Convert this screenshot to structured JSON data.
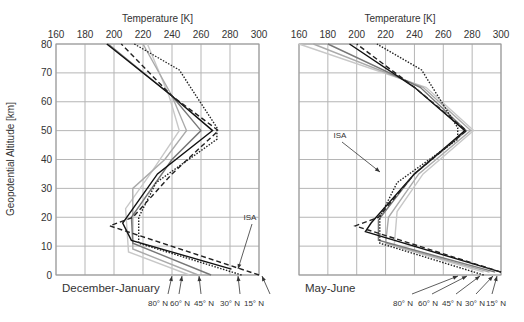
{
  "figure": {
    "ylabel": "Geopotential Altitude [km]",
    "isa_label": "ISA",
    "latitude_labels": [
      "80° N",
      "60° N",
      "45° N",
      "30° N",
      "15° N"
    ]
  },
  "chart_data": [
    {
      "type": "line",
      "title": "December-January",
      "xlabel": "Temperature [K]",
      "ylabel": "Geopotential Altitude [km]",
      "xlim": [
        160,
        300
      ],
      "ylim": [
        0,
        80
      ],
      "xticks": [
        160,
        180,
        200,
        220,
        240,
        260,
        280,
        300
      ],
      "yticks": [
        0,
        10,
        20,
        30,
        40,
        50,
        60,
        70,
        80
      ],
      "xaxis_position": "top",
      "grid": true,
      "annotations": [
        "ISA",
        "80° N",
        "60° N",
        "45° N",
        "30° N",
        "15° N"
      ],
      "series": [
        {
          "name": "ISA",
          "style": "dotted",
          "color": "#222222",
          "points": [
            [
              288,
              0
            ],
            [
              217,
              11
            ],
            [
              217,
              20
            ],
            [
              229,
              32
            ],
            [
              271,
              47
            ],
            [
              271,
              51
            ],
            [
              245,
              71
            ],
            [
              214,
              80
            ]
          ]
        },
        {
          "name": "15° N",
          "style": "dashed",
          "color": "#222222",
          "points": [
            [
              300,
              0
            ],
            [
              197,
              17
            ],
            [
              213,
              20
            ],
            [
              240,
              35
            ],
            [
              272,
              50
            ],
            [
              240,
              62
            ],
            [
              205,
              80
            ]
          ]
        },
        {
          "name": "30° N",
          "style": "solid",
          "color": "#111111",
          "points": [
            [
              281,
              2
            ],
            [
              212,
              12
            ],
            [
              206,
              18
            ],
            [
              230,
              35
            ],
            [
              268,
              50
            ],
            [
              240,
              62
            ],
            [
              195,
              80
            ]
          ]
        },
        {
          "name": "45° N",
          "style": "solid",
          "color": "#777777",
          "points": [
            [
              267,
              0
            ],
            [
              213,
              11
            ],
            [
              212,
              20
            ],
            [
              240,
              40
            ],
            [
              260,
              50
            ],
            [
              240,
              62
            ],
            [
              196,
              80
            ]
          ]
        },
        {
          "name": "60° N",
          "style": "solid",
          "color": "#aaaaaa",
          "points": [
            [
              258,
              0
            ],
            [
              213,
              9
            ],
            [
              213,
              30
            ],
            [
              235,
              40
            ],
            [
              250,
              50
            ],
            [
              240,
              62
            ],
            [
              220,
              80
            ]
          ]
        },
        {
          "name": "80° N",
          "style": "solid",
          "color": "#c8c8c8",
          "points": [
            [
              252,
              0
            ],
            [
              210,
              8
            ],
            [
              208,
              23
            ],
            [
              225,
              35
            ],
            [
              245,
              50
            ],
            [
              238,
              62
            ],
            [
              223,
              80
            ]
          ]
        }
      ]
    },
    {
      "type": "line",
      "title": "May-June",
      "xlabel": "Temperature [K]",
      "ylabel": "Geopotential Altitude [km]",
      "xlim": [
        160,
        300
      ],
      "ylim": [
        0,
        80
      ],
      "xticks": [
        160,
        180,
        200,
        220,
        240,
        260,
        280,
        300
      ],
      "yticks": [
        0,
        10,
        20,
        30,
        40,
        50,
        60,
        70,
        80
      ],
      "xaxis_position": "top",
      "grid": true,
      "annotations": [
        "ISA",
        "80° N",
        "60° N",
        "45° N",
        "30° N",
        "15° N"
      ],
      "series": [
        {
          "name": "ISA",
          "style": "dotted",
          "color": "#222222",
          "points": [
            [
              288,
              0
            ],
            [
              216,
              11
            ],
            [
              216,
              20
            ],
            [
              228,
              32
            ],
            [
              270,
              47
            ],
            [
              270,
              51
            ],
            [
              245,
              71
            ],
            [
              214,
              80
            ]
          ]
        },
        {
          "name": "15° N",
          "style": "dashed",
          "color": "#222222",
          "points": [
            [
              300,
              1
            ],
            [
              199,
              17
            ],
            [
              215,
              20
            ],
            [
              240,
              35
            ],
            [
              276,
              50
            ],
            [
              240,
              65
            ],
            [
              200,
              80
            ]
          ]
        },
        {
          "name": "30° N",
          "style": "solid",
          "color": "#111111",
          "points": [
            [
              300,
              1
            ],
            [
              206,
              15
            ],
            [
              210,
              18
            ],
            [
              240,
              35
            ],
            [
              275,
              50
            ],
            [
              240,
              65
            ],
            [
              195,
              80
            ]
          ]
        },
        {
          "name": "45° N",
          "style": "solid",
          "color": "#777777",
          "points": [
            [
              296,
              1
            ],
            [
              215,
              12
            ],
            [
              215,
              19
            ],
            [
              240,
              35
            ],
            [
              276,
              50
            ],
            [
              244,
              65
            ],
            [
              180,
              80
            ]
          ]
        },
        {
          "name": "60° N",
          "style": "solid",
          "color": "#aaaaaa",
          "points": [
            [
              292,
              1
            ],
            [
              220,
              11
            ],
            [
              222,
              20
            ],
            [
              243,
              35
            ],
            [
              279,
              50
            ],
            [
              246,
              65
            ],
            [
              170,
              80
            ]
          ]
        },
        {
          "name": "80° N",
          "style": "solid",
          "color": "#c8c8c8",
          "points": [
            [
              288,
              1
            ],
            [
              226,
              10
            ],
            [
              228,
              22
            ],
            [
              246,
              35
            ],
            [
              281,
              50
            ],
            [
              248,
              65
            ],
            [
              160,
              80
            ]
          ]
        }
      ]
    }
  ]
}
